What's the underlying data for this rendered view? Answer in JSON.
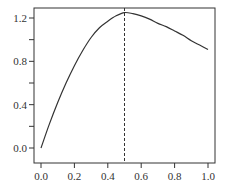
{
  "chart_data": {
    "type": "line",
    "title": "",
    "xlabel": "",
    "ylabel": "",
    "xlim": [
      0.0,
      1.0
    ],
    "ylim": [
      0.0,
      1.2
    ],
    "x_ticks": [
      "0.0",
      "0.2",
      "0.4",
      "0.6",
      "0.8",
      "1.0"
    ],
    "y_ticks": [
      "0.0",
      "0.4",
      "0.8",
      "1.2"
    ],
    "y_minor_ticks": [
      0.2,
      0.6,
      1.0
    ],
    "grid": false,
    "series": [
      {
        "name": "curve",
        "style": "solid",
        "color": "#333333",
        "x": [
          0.0,
          0.05,
          0.1,
          0.15,
          0.2,
          0.25,
          0.3,
          0.35,
          0.4,
          0.45,
          0.5,
          0.55,
          0.6,
          0.65,
          0.7,
          0.75,
          0.8,
          0.85,
          0.9,
          0.95,
          1.0
        ],
        "y": [
          0.0,
          0.22,
          0.42,
          0.6,
          0.76,
          0.9,
          1.02,
          1.11,
          1.17,
          1.22,
          1.25,
          1.24,
          1.22,
          1.19,
          1.15,
          1.12,
          1.08,
          1.04,
          0.99,
          0.95,
          0.91
        ]
      }
    ],
    "annotations": [
      {
        "type": "vertical-line",
        "x": 0.5,
        "style": "dashed",
        "color": "#333333"
      }
    ]
  }
}
